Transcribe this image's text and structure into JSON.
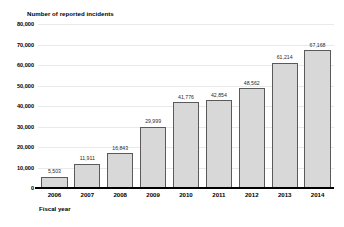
{
  "chart_data": {
    "type": "bar",
    "title": "Number of reported incidents",
    "xlabel": "Fiscal year",
    "ylabel": "Number of reported incidents",
    "categories": [
      "2006",
      "2007",
      "2008",
      "2009",
      "2010",
      "2011",
      "2012",
      "2013",
      "2014"
    ],
    "values": [
      5503,
      11911,
      16843,
      29999,
      41776,
      42854,
      48562,
      61214,
      67168
    ],
    "value_labels": [
      "5,503",
      "11,911",
      "16,843",
      "29,999",
      "41,776",
      "42,854",
      "48,562",
      "61,214",
      "67,168"
    ],
    "ylim": [
      0,
      80000
    ],
    "ytick_values": [
      0,
      10000,
      20000,
      30000,
      40000,
      50000,
      60000,
      70000,
      80000
    ],
    "ytick_labels": [
      "0",
      "10,000",
      "20,000",
      "30,000",
      "40,000",
      "50,000",
      "60,000",
      "70,000",
      "80,000"
    ],
    "grid": true,
    "legend": null,
    "bar_color": "#d8d8d8",
    "bar_border_color": "#5a5a5a",
    "gridline_color": "#e9e9e9",
    "axis_color": "#000000"
  }
}
